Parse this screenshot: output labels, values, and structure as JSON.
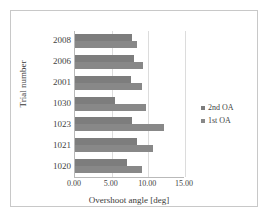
{
  "chart_data": {
    "type": "bar",
    "orientation": "horizontal",
    "title": "",
    "xlabel": "Overshoot angle [deg]",
    "ylabel": "Trial number",
    "categories": [
      "1020",
      "1021",
      "1023",
      "1030",
      "2001",
      "2006",
      "2008"
    ],
    "category_order_top_to_bottom": [
      "2008",
      "2006",
      "2001",
      "1030",
      "1023",
      "1021",
      "1020"
    ],
    "series": [
      {
        "name": "1st OA",
        "values": [
          9.1,
          10.7,
          12.2,
          9.7,
          9.2,
          9.3,
          8.5
        ]
      },
      {
        "name": "2nd OA",
        "values": [
          7.1,
          8.4,
          7.8,
          5.5,
          7.6,
          8.0,
          7.8
        ]
      }
    ],
    "xlim": [
      0.0,
      15.0
    ],
    "xticks": [
      0.0,
      5.0,
      10.0,
      15.0
    ],
    "xtick_labels": [
      "0.00",
      "5.00",
      "10.00",
      "15.00"
    ],
    "grid": "vertical",
    "legend_position": "right",
    "bar_color": "#808080"
  },
  "legend": {
    "items": [
      {
        "label": "2nd OA",
        "color": "#7d7d7d"
      },
      {
        "label": "1st OA",
        "color": "#888888"
      }
    ]
  },
  "axes": {
    "x_title": "Overshoot angle [deg]",
    "y_title": "Trial number"
  }
}
